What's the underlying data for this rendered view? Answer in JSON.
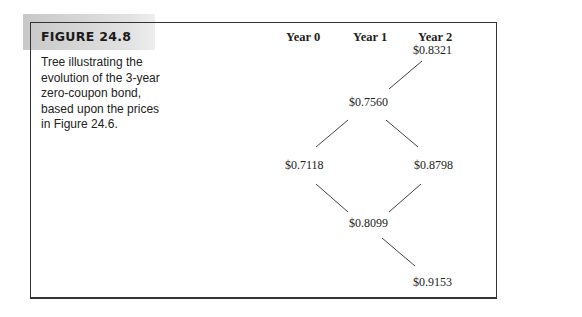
{
  "figure": {
    "label": "FIGURE 24.8",
    "caption": "Tree illustrating the evolution of the 3-year zero-coupon bond, based upon the prices in Figure 24.6."
  },
  "tree": {
    "years": [
      "Year 0",
      "Year 1",
      "Year 2"
    ],
    "nodes": {
      "n_top": "$0.8321",
      "n_upper_mid": "$0.7560",
      "n_left": "$0.7118",
      "n_right": "$0.8798",
      "n_lower_mid": "$0.8099",
      "n_bottom": "$0.9153"
    },
    "edges": [
      [
        "n_upper_mid",
        "n_top"
      ],
      [
        "n_upper_mid",
        "n_left"
      ],
      [
        "n_upper_mid",
        "n_right"
      ],
      [
        "n_left",
        "n_lower_mid"
      ],
      [
        "n_right",
        "n_lower_mid"
      ],
      [
        "n_lower_mid",
        "n_bottom"
      ]
    ]
  }
}
